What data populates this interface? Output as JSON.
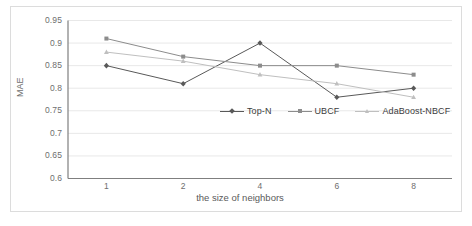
{
  "chart_data": {
    "type": "line",
    "title": "",
    "xlabel": "the size of neighbors",
    "ylabel": "MAE",
    "categories": [
      "1",
      "2",
      "4",
      "6",
      "8"
    ],
    "x_tick_labels": [
      "1",
      "2",
      "4",
      "6",
      "8"
    ],
    "y_tick_labels": [
      "0.95",
      "0.9",
      "0.85",
      "0.8",
      "0.75",
      "0.7",
      "0.65",
      "0.6"
    ],
    "y_tick_values": [
      0.95,
      0.9,
      0.85,
      0.8,
      0.75,
      0.7,
      0.65,
      0.6
    ],
    "ylim": [
      0.6,
      0.95
    ],
    "grid": "horizontal",
    "legend_position": "inside-center-right",
    "series": [
      {
        "name": "Top-N",
        "color": "#595959",
        "marker": "diamond",
        "values": [
          0.85,
          0.81,
          0.9,
          0.78,
          0.8
        ]
      },
      {
        "name": "UBCF",
        "color": "#8c8c8c",
        "marker": "square",
        "values": [
          0.91,
          0.87,
          0.85,
          0.85,
          0.83
        ]
      },
      {
        "name": "AdaBoost-NBCF",
        "color": "#bfbfbf",
        "marker": "triangle",
        "values": [
          0.88,
          0.86,
          0.83,
          0.81,
          0.78
        ]
      }
    ]
  },
  "axes": {
    "y_title": "MAE",
    "x_title": "the size of neighbors"
  },
  "legend": {
    "items": [
      {
        "label": "Top-N"
      },
      {
        "label": "UBCF"
      },
      {
        "label": "AdaBoost-NBCF"
      }
    ]
  },
  "colors": {
    "series_1": "#595959",
    "series_2": "#8c8c8c",
    "series_3": "#bfbfbf",
    "axis": "#7f7f7f",
    "grid": "#e8e8e8",
    "border": "#dcdcdc",
    "text": "#6e6e6e"
  }
}
